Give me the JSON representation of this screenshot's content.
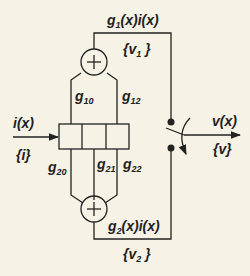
{
  "diagram": {
    "input": {
      "signal": "i(x)",
      "set": "{i}"
    },
    "output": {
      "signal": "v(x)",
      "set": "{v}"
    },
    "branch_top": {
      "signal_g": "g",
      "signal_sub": "1",
      "signal_rest": "(x)i(x)",
      "set_prefix": "{v",
      "set_sub": "1",
      "set_suffix": " }"
    },
    "branch_bottom": {
      "signal_g": "g",
      "signal_sub": "2",
      "signal_rest": "(x)i(x)",
      "set_prefix": "{v",
      "set_sub": "2",
      "set_suffix": " }"
    },
    "gains": [
      {
        "g": "g",
        "sub": "10"
      },
      {
        "g": "g",
        "sub": "12"
      },
      {
        "g": "g",
        "sub": "20"
      },
      {
        "g": "g",
        "sub": "21"
      },
      {
        "g": "g",
        "sub": "22"
      }
    ],
    "adder_symbol": "+",
    "colors": {
      "background": "#f6f3e6",
      "ink": "#222222"
    }
  }
}
